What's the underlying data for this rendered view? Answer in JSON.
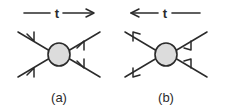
{
  "figure": {
    "type": "feynman-scattering-diagrams",
    "background_color": "#ffffff",
    "line_color": "#2b2b2b",
    "blob_fill_color": "#dcdcdc",
    "panels": [
      {
        "id": "a",
        "caption": "(a)",
        "time_axis": {
          "label": "t",
          "direction": "right",
          "arrow_glyph": "→",
          "description": "time arrow pointing right"
        },
        "vertex": {
          "shape": "circle",
          "fill": "#dcdcdc"
        },
        "legs": [
          {
            "name": "upper-left",
            "flow": "incoming",
            "arrow_direction": "down-right"
          },
          {
            "name": "lower-left",
            "flow": "incoming",
            "arrow_direction": "up-right"
          },
          {
            "name": "upper-right",
            "flow": "outgoing",
            "arrow_direction": "up-right"
          },
          {
            "name": "lower-right",
            "flow": "outgoing",
            "arrow_direction": "down-right"
          }
        ]
      },
      {
        "id": "b",
        "caption": "(b)",
        "time_axis": {
          "label": "t",
          "direction": "left",
          "arrow_glyph": "←",
          "description": "time arrow pointing left"
        },
        "vertex": {
          "shape": "circle",
          "fill": "#dcdcdc"
        },
        "legs": [
          {
            "name": "upper-left",
            "flow": "outgoing",
            "arrow_direction": "up-left"
          },
          {
            "name": "lower-left",
            "flow": "outgoing",
            "arrow_direction": "down-left"
          },
          {
            "name": "upper-right",
            "flow": "incoming",
            "arrow_direction": "down-left"
          },
          {
            "name": "lower-right",
            "flow": "incoming",
            "arrow_direction": "up-left"
          }
        ]
      }
    ]
  }
}
